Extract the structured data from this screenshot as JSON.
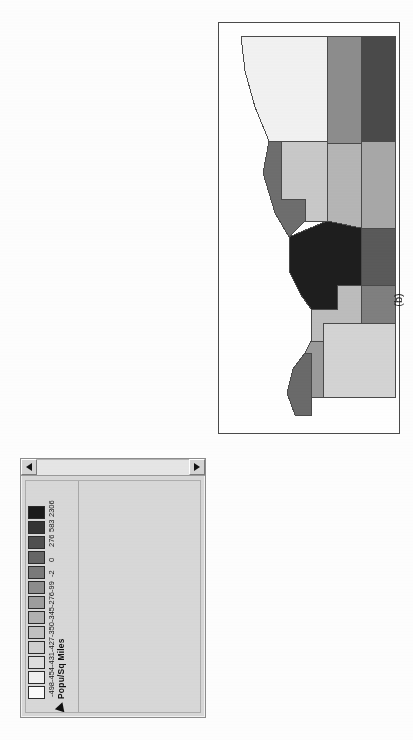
{
  "figure": {
    "caption": "(b)"
  },
  "legend_window": {
    "scrollbar": {
      "left_arrow": "left-arrow-icon",
      "right_arrow": "right-arrow-icon"
    },
    "pointer_icon": "arrow-cursor-icon",
    "title": "Popu/Sq Miles",
    "breaks": [
      "-498",
      "-454",
      "-431",
      "-427",
      "-350",
      "-345",
      "-276",
      "-99",
      "-2",
      "0",
      "276",
      "583",
      "2306"
    ],
    "swatch_colors": [
      "#fbfbfb",
      "#f0f0f0",
      "#dedede",
      "#cfcfcf",
      "#c2c2c2",
      "#b2b2b2",
      "#9e9e9e",
      "#8d8d8d",
      "#7a7a7a",
      "#666666",
      "#4f4f4f",
      "#353535",
      "#1b1b1b"
    ]
  },
  "chart_data": {
    "type": "heatmap",
    "title": "Popu/Sq Miles",
    "subtitle": "",
    "xlabel": "",
    "ylabel": "",
    "legend_position": "left-panel",
    "grid": false,
    "categories": [
      "-498",
      "-454",
      "-431",
      "-427",
      "-350",
      "-345",
      "-276",
      "-99",
      "-2",
      "0",
      "276",
      "583",
      "2306"
    ],
    "values": [
      -498,
      -454,
      -431,
      -427,
      -350,
      -345,
      -276,
      -99,
      -2,
      0,
      276,
      583,
      2306
    ],
    "colors": [
      "#fbfbfb",
      "#f0f0f0",
      "#dedede",
      "#cfcfcf",
      "#c2c2c2",
      "#b2b2b2",
      "#9e9e9e",
      "#8d8d8d",
      "#7a7a7a",
      "#666666",
      "#4f4f4f",
      "#353535",
      "#1b1b1b"
    ],
    "regions": [
      {
        "name": "region-1",
        "fill": "#f2f2f2",
        "class_index": 1
      },
      {
        "name": "region-2",
        "fill": "#8d8d8d",
        "class_index": 7
      },
      {
        "name": "region-3",
        "fill": "#4a4a4a",
        "class_index": 11
      },
      {
        "name": "region-4",
        "fill": "#c9c9c9",
        "class_index": 3
      },
      {
        "name": "region-5",
        "fill": "#6e6e6e",
        "class_index": 9
      },
      {
        "name": "region-6",
        "fill": "#b6b6b6",
        "class_index": 5
      },
      {
        "name": "region-7",
        "fill": "#a8a8a8",
        "class_index": 6
      },
      {
        "name": "region-8",
        "fill": "#1e1e1e",
        "class_index": 12
      },
      {
        "name": "region-9",
        "fill": "#5a5a5a",
        "class_index": 10
      },
      {
        "name": "region-10",
        "fill": "#bdbdbd",
        "class_index": 4
      },
      {
        "name": "region-11",
        "fill": "#7f7f7f",
        "class_index": 8
      },
      {
        "name": "region-12",
        "fill": "#d4d4d4",
        "class_index": 2
      },
      {
        "name": "region-13",
        "fill": "#9b9b9b",
        "class_index": 6
      },
      {
        "name": "region-14",
        "fill": "#6a6a6a",
        "class_index": 9
      }
    ]
  }
}
